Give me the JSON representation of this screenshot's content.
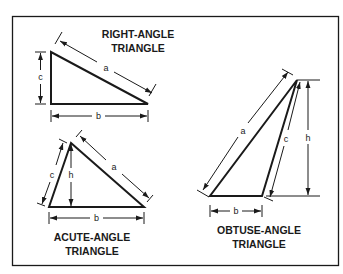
{
  "diagram": {
    "frame": {
      "color": "#1a1a1a",
      "background": "#ffffff"
    },
    "triangles": [
      {
        "id": "right",
        "title_lines": [
          "RIGHT-ANGLE",
          "TRIANGLE"
        ],
        "sides": {
          "a": "a",
          "b": "b",
          "c": "c"
        }
      },
      {
        "id": "acute",
        "title_lines": [
          "ACUTE-ANGLE",
          "TRIANGLE"
        ],
        "sides": {
          "a": "a",
          "b": "b",
          "c": "c",
          "h": "h"
        }
      },
      {
        "id": "obtuse",
        "title_lines": [
          "OBTUSE-ANGLE",
          "TRIANGLE"
        ],
        "sides": {
          "a": "a",
          "b": "b",
          "c": "c",
          "h": "h"
        }
      }
    ]
  }
}
